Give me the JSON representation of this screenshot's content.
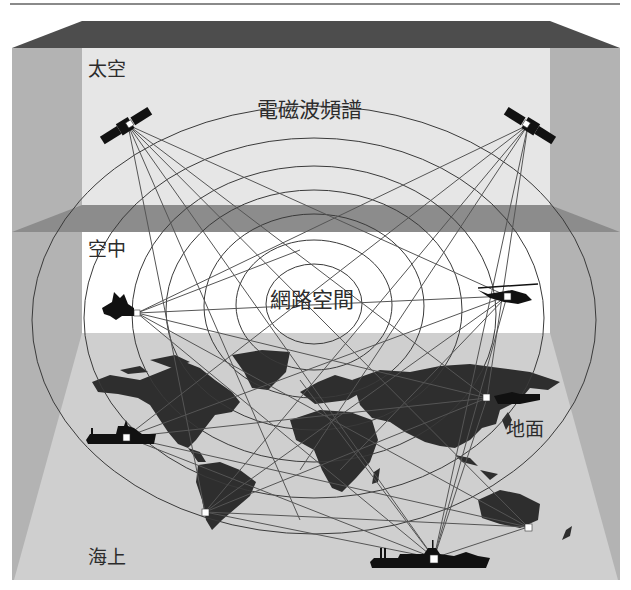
{
  "diagram": {
    "type": "multi-domain operations diagram",
    "layers": [
      {
        "id": "space",
        "label": "太空"
      },
      {
        "id": "air",
        "label": "空中"
      },
      {
        "id": "land",
        "label": "地面"
      },
      {
        "id": "sea",
        "label": "海上"
      }
    ],
    "overlays": {
      "spectrum_label": "電磁波頻譜",
      "cyber_label": "網路空間"
    },
    "nodes": [
      {
        "id": "satellite-left",
        "kind": "satellite",
        "layer": "space"
      },
      {
        "id": "satellite-right",
        "kind": "satellite",
        "layer": "space"
      },
      {
        "id": "fighter-jet",
        "kind": "aircraft",
        "layer": "air"
      },
      {
        "id": "helicopter",
        "kind": "helicopter",
        "layer": "air"
      },
      {
        "id": "ship-left",
        "kind": "ship",
        "layer": "sea"
      },
      {
        "id": "south-america-station",
        "kind": "ground-station",
        "layer": "land"
      },
      {
        "id": "asia-tank",
        "kind": "tank",
        "layer": "land"
      },
      {
        "id": "australia-station",
        "kind": "ground-station",
        "layer": "land"
      },
      {
        "id": "ship-bottom",
        "kind": "ship",
        "layer": "sea"
      }
    ],
    "colors": {
      "roof": "#4d4d4d",
      "side_wall": "#b3b3b3",
      "space_panel": "#e6e6e6",
      "air_panel": "#ffffff",
      "separator": "#8c8c8c",
      "floor": "#cfcfcf",
      "continents": "#2e2e2e",
      "links": "#555555"
    }
  }
}
